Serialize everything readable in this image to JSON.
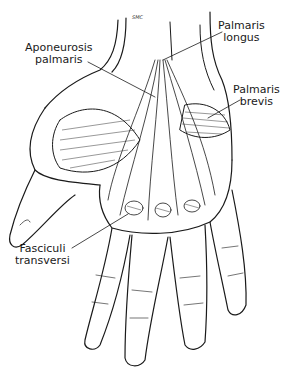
{
  "figure": {
    "signature": "SMC",
    "colors": {
      "ink": "#1a1a1a",
      "background": "#ffffff"
    }
  },
  "labels": [
    {
      "id": "aponeurosis-palmaris",
      "lines": [
        "Aponeurosis",
        "palmaris"
      ]
    },
    {
      "id": "palmaris-longus",
      "lines": [
        "Palmaris",
        "longus"
      ]
    },
    {
      "id": "palmaris-brevis",
      "lines": [
        "Palmaris",
        "brevis"
      ]
    },
    {
      "id": "fasciculi-transversi",
      "lines": [
        "Fasciculi",
        "transversi"
      ]
    }
  ]
}
